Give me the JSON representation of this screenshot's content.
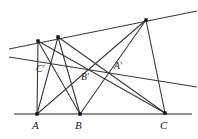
{
  "figure": {
    "name": "pappus-hexagon-theorem-diagram",
    "type": "geometric-line-diagram",
    "width": 198,
    "height": 139,
    "background_color": "#ffffff",
    "line_color": "#3a3a3a",
    "baseline_color": "#6b6b6b",
    "point_color": "#111111",
    "label_color": "#1a1a1a"
  },
  "labels": {
    "A": "A",
    "B": "B",
    "C": "C",
    "A_prime": "A'",
    "B_prime": "B'",
    "C_prime": "C'"
  },
  "points": {
    "A": {
      "x": 37,
      "y": 114,
      "marker": true,
      "label_x": 32,
      "label_y": 120
    },
    "B": {
      "x": 80,
      "y": 114,
      "marker": true,
      "label_x": 75,
      "label_y": 120
    },
    "C": {
      "x": 165,
      "y": 113,
      "marker": true,
      "label_x": 160,
      "label_y": 120
    },
    "P1": {
      "x": 38,
      "y": 41,
      "marker": true
    },
    "P2": {
      "x": 58,
      "y": 37,
      "marker": true
    },
    "P3": {
      "x": 146,
      "y": 20,
      "marker": true
    },
    "A_prime": {
      "x": 110,
      "y": 72,
      "marker": false,
      "label_x": 114,
      "label_y": 62
    },
    "B_prime": {
      "x": 87,
      "y": 69,
      "marker": false,
      "label_x": 81,
      "label_y": 73
    },
    "C_prime": {
      "x": 50,
      "y": 62,
      "marker": false,
      "label_x": 36,
      "label_y": 65
    }
  },
  "lines": [
    {
      "name": "baseline-ABC",
      "x1": 14,
      "y1": 114,
      "x2": 192,
      "y2": 114,
      "width": 1.5,
      "color": "#6b6b6b"
    },
    {
      "name": "upper-line-P1P2P3",
      "x1": 9,
      "y1": 49,
      "x2": 197,
      "y2": 11,
      "width": 1.1,
      "color": "#3a3a3a"
    },
    {
      "name": "pappus-line",
      "x1": 9,
      "y1": 57,
      "x2": 197,
      "y2": 87,
      "width": 1.1,
      "color": "#3a3a3a"
    },
    {
      "name": "segment-A-P1",
      "x1": 37,
      "y1": 114,
      "x2": 38,
      "y2": 41,
      "width": 1.1,
      "color": "#3a3a3a"
    },
    {
      "name": "segment-A-P2",
      "x1": 37,
      "y1": 114,
      "x2": 58,
      "y2": 37,
      "width": 1.1,
      "color": "#3a3a3a"
    },
    {
      "name": "segment-A-P3",
      "x1": 37,
      "y1": 114,
      "x2": 146,
      "y2": 20,
      "width": 1.1,
      "color": "#3a3a3a"
    },
    {
      "name": "segment-B-P1",
      "x1": 80,
      "y1": 114,
      "x2": 38,
      "y2": 41,
      "width": 1.1,
      "color": "#3a3a3a"
    },
    {
      "name": "segment-B-P2",
      "x1": 80,
      "y1": 114,
      "x2": 58,
      "y2": 37,
      "width": 1.1,
      "color": "#3a3a3a"
    },
    {
      "name": "segment-B-P3",
      "x1": 80,
      "y1": 114,
      "x2": 146,
      "y2": 20,
      "width": 1.1,
      "color": "#3a3a3a"
    },
    {
      "name": "segment-C-P1",
      "x1": 165,
      "y1": 113,
      "x2": 38,
      "y2": 41,
      "width": 1.1,
      "color": "#3a3a3a"
    },
    {
      "name": "segment-C-P2",
      "x1": 165,
      "y1": 113,
      "x2": 58,
      "y2": 37,
      "width": 1.1,
      "color": "#3a3a3a"
    },
    {
      "name": "segment-C-P3",
      "x1": 165,
      "y1": 113,
      "x2": 146,
      "y2": 20,
      "width": 1.1,
      "color": "#3a3a3a"
    }
  ]
}
